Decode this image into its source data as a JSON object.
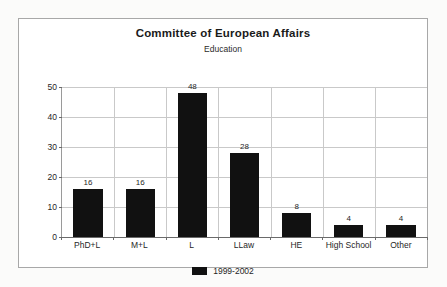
{
  "chart_data": {
    "type": "bar",
    "title": "Committee of European Affairs",
    "subtitle": "Education",
    "xlabel": "",
    "ylabel": "",
    "categories": [
      "PhD+L",
      "M+L",
      "L",
      "LLaw",
      "HE",
      "High School",
      "Other"
    ],
    "series": [
      {
        "name": "1999-2002",
        "values": [
          16,
          16,
          48,
          28,
          8,
          4,
          4
        ],
        "color": "#111111"
      }
    ],
    "data_labels": [
      "16",
      "16",
      "48",
      "28",
      "8",
      "4",
      "4"
    ],
    "ylim": [
      0,
      50
    ],
    "y_ticks": [
      "0",
      "10",
      "20",
      "30",
      "40",
      "50"
    ],
    "grid": true,
    "legend_position": "bottom"
  },
  "legend": {
    "entries": [
      {
        "label": "1999-2002",
        "color": "#111111"
      }
    ]
  }
}
